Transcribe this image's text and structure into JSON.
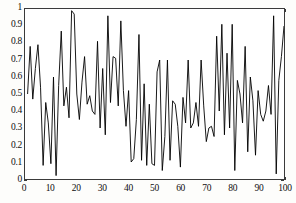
{
  "chart_data": {
    "type": "line",
    "title": "",
    "xlabel": "",
    "ylabel": "",
    "xlim": [
      0,
      100
    ],
    "ylim": [
      0,
      1
    ],
    "grid": false,
    "legend": null,
    "line_color": "#000000",
    "line_width": 0.9,
    "x_ticks": [
      "0",
      "10",
      "20",
      "30",
      "40",
      "50",
      "60",
      "70",
      "80",
      "90",
      "100"
    ],
    "x_tick_values": [
      0,
      10,
      20,
      30,
      40,
      50,
      60,
      70,
      80,
      90,
      100
    ],
    "y_ticks": [
      "0",
      "0.1",
      "0.2",
      "0.3",
      "0.4",
      "0.5",
      "0.6",
      "0.7",
      "0.8",
      "0.9",
      "1"
    ],
    "y_tick_values": [
      0,
      0.1,
      0.2,
      0.3,
      0.4,
      0.5,
      0.6,
      0.7,
      0.8,
      0.9,
      1
    ],
    "x": [
      1,
      2,
      3,
      4,
      5,
      6,
      7,
      8,
      9,
      10,
      11,
      12,
      13,
      14,
      15,
      16,
      17,
      18,
      19,
      20,
      21,
      22,
      23,
      24,
      25,
      26,
      27,
      28,
      29,
      30,
      31,
      32,
      33,
      34,
      35,
      36,
      37,
      38,
      39,
      40,
      41,
      42,
      43,
      44,
      45,
      46,
      47,
      48,
      49,
      50,
      51,
      52,
      53,
      54,
      55,
      56,
      57,
      58,
      59,
      60,
      61,
      62,
      63,
      64,
      65,
      66,
      67,
      68,
      69,
      70,
      71,
      72,
      73,
      74,
      75,
      76,
      77,
      78,
      79,
      80,
      81,
      82,
      83,
      84,
      85,
      86,
      87,
      88,
      89,
      90,
      91,
      92,
      93,
      94,
      95,
      96,
      97,
      98,
      99,
      100
    ],
    "values": [
      0.5,
      0.78,
      0.47,
      0.65,
      0.79,
      0.54,
      0.08,
      0.45,
      0.33,
      0.09,
      0.6,
      0.02,
      0.55,
      0.87,
      0.43,
      0.54,
      0.36,
      0.99,
      0.97,
      0.5,
      0.35,
      0.57,
      0.72,
      0.44,
      0.49,
      0.4,
      0.38,
      0.81,
      0.3,
      0.65,
      0.26,
      0.96,
      0.45,
      0.72,
      0.71,
      0.43,
      0.93,
      0.52,
      0.31,
      0.52,
      0.1,
      0.12,
      0.35,
      0.85,
      0.11,
      0.56,
      0.08,
      0.44,
      0.09,
      0.08,
      0.63,
      0.7,
      0.05,
      0.25,
      0.7,
      0.11,
      0.46,
      0.44,
      0.31,
      0.07,
      0.48,
      0.33,
      0.7,
      0.3,
      0.33,
      0.45,
      0.31,
      0.7,
      0.43,
      0.22,
      0.3,
      0.31,
      0.25,
      0.84,
      0.4,
      0.91,
      0.26,
      0.74,
      0.3,
      0.91,
      0.05,
      0.58,
      0.5,
      0.33,
      0.78,
      0.16,
      0.6,
      0.46,
      0.14,
      0.52,
      0.38,
      0.34,
      0.4,
      0.55,
      0.38,
      0.96,
      0.03,
      0.58,
      0.72,
      0.9
    ]
  }
}
